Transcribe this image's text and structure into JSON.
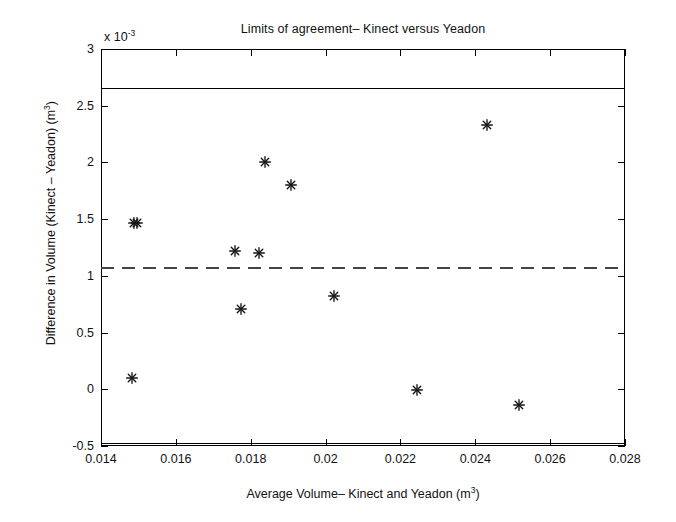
{
  "chart_data": {
    "type": "scatter",
    "title": "Limits of agreement– Kinect versus Yeadon",
    "xlabel": "Average Volume– Kinect and Yeadon (m",
    "xlabel_sup": "3",
    "xlabel_end": ")",
    "ylabel": "Difference in Volume (Kinect – Yeadon) (m",
    "ylabel_sup": "3",
    "ylabel_end": ")",
    "y_exponent_prefix": "x 10",
    "y_exponent_value": "-3",
    "xlim": [
      0.014,
      0.028
    ],
    "ylim": [
      -0.5,
      3
    ],
    "y_scale_factor": 0.001,
    "grid": false,
    "legend": null,
    "xticks": [
      "0.014",
      "0.016",
      "0.018",
      "0.02",
      "0.022",
      "0.024",
      "0.026",
      "0.028"
    ],
    "xtick_values": [
      0.014,
      0.016,
      0.018,
      0.02,
      0.022,
      0.024,
      0.026,
      0.028
    ],
    "yticks": [
      "-0.5",
      "0",
      "0.5",
      "1",
      "1.5",
      "2",
      "2.5",
      "3"
    ],
    "ytick_values": [
      -0.5,
      0,
      0.5,
      1,
      1.5,
      2,
      2.5,
      3
    ],
    "marker": "asterisk",
    "marker_color": "#151515",
    "points": [
      {
        "x": 0.01482,
        "y": 0.1
      },
      {
        "x": 0.01487,
        "y": 1.47
      },
      {
        "x": 0.01495,
        "y": 1.47
      },
      {
        "x": 0.01757,
        "y": 1.22
      },
      {
        "x": 0.01775,
        "y": 0.71
      },
      {
        "x": 0.01822,
        "y": 1.2
      },
      {
        "x": 0.01838,
        "y": 2.0
      },
      {
        "x": 0.01908,
        "y": 1.8
      },
      {
        "x": 0.02022,
        "y": 0.82
      },
      {
        "x": 0.02245,
        "y": -0.01
      },
      {
        "x": 0.02432,
        "y": 2.33
      },
      {
        "x": 0.02517,
        "y": -0.14
      }
    ],
    "reference_lines": [
      {
        "name": "upper-limit-of-agreement",
        "y": 2.655,
        "style": "solid",
        "color": "#000000"
      },
      {
        "name": "mean-difference",
        "y": 1.075,
        "style": "dashed",
        "color": "#444444"
      },
      {
        "name": "lower-limit-of-agreement",
        "y": -0.475,
        "style": "solid",
        "color": "#000000"
      }
    ]
  }
}
